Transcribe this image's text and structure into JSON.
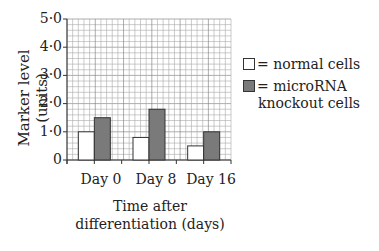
{
  "chart_data": {
    "type": "bar",
    "title": "",
    "xlabel": "Time after differentiation (days)",
    "xlabel_lines": [
      "Time after",
      "differentiation (days)"
    ],
    "ylabel": "Marker level (units)",
    "ylim": [
      0,
      5.0
    ],
    "yticks": [
      "0",
      "1·0",
      "2·0",
      "3·0",
      "4·0",
      "5·0"
    ],
    "grid": true,
    "categories": [
      "Day 0",
      "Day 8",
      "Day 16"
    ],
    "series": [
      {
        "name": "normal cells",
        "color": "#ffffff",
        "values": [
          1.0,
          0.8,
          0.5
        ]
      },
      {
        "name": "microRNA knockout cells",
        "color": "#7a7a7a",
        "values": [
          1.5,
          1.8,
          1.0
        ]
      }
    ],
    "legend": {
      "position": "right",
      "entries": [
        {
          "label": "= normal cells",
          "lines": [
            "= normal cells"
          ]
        },
        {
          "label": "= microRNA knockout cells",
          "lines": [
            "= microRNA",
            "knockout cells"
          ]
        }
      ]
    }
  }
}
